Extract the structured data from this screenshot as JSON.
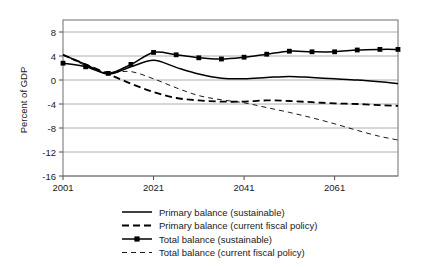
{
  "chart_data": {
    "type": "line",
    "title": "",
    "xlabel": "",
    "ylabel": "Percent of GDP",
    "xlim": [
      2001,
      2075
    ],
    "ylim": [
      -16,
      10
    ],
    "yticks": [
      8,
      4,
      0,
      -4,
      -8,
      -12,
      -16
    ],
    "ytick_labels": [
      "8",
      "4",
      "0",
      "-4",
      "-8",
      "-12",
      "-16"
    ],
    "xticks": [
      2001,
      2021,
      2041,
      2061
    ],
    "xtick_labels": [
      "2001",
      "2021",
      "2041",
      "2061"
    ],
    "grid": "horizontal",
    "legend_position": "bottom",
    "series": [
      {
        "name": "Primary balance (sustainable)",
        "style": "solid",
        "marker": "none",
        "color": "#000000",
        "x": [
          2001,
          2006,
          2011,
          2016,
          2021,
          2026,
          2031,
          2036,
          2041,
          2046,
          2051,
          2056,
          2061,
          2066,
          2071,
          2075
        ],
        "values": [
          4.2,
          2.6,
          1.0,
          2.2,
          3.3,
          2.1,
          1.0,
          0.3,
          0.2,
          0.4,
          0.6,
          0.4,
          0.2,
          0.0,
          -0.3,
          -0.6
        ]
      },
      {
        "name": "Primary balance (current fiscal policy)",
        "style": "dashed",
        "marker": "none",
        "color": "#000000",
        "x": [
          2001,
          2006,
          2011,
          2016,
          2021,
          2026,
          2031,
          2036,
          2041,
          2046,
          2051,
          2056,
          2061,
          2066,
          2071,
          2075
        ],
        "values": [
          4.2,
          2.6,
          1.0,
          -0.6,
          -2.0,
          -3.0,
          -3.4,
          -3.6,
          -3.6,
          -3.4,
          -3.5,
          -3.7,
          -3.9,
          -4.0,
          -4.2,
          -4.3
        ]
      },
      {
        "name": "Total balance (sustainable)",
        "style": "solid",
        "marker": "square",
        "color": "#000000",
        "x": [
          2001,
          2006,
          2011,
          2016,
          2021,
          2026,
          2031,
          2036,
          2041,
          2046,
          2051,
          2056,
          2061,
          2066,
          2071,
          2075
        ],
        "values": [
          2.8,
          2.2,
          1.1,
          2.6,
          4.6,
          4.2,
          3.7,
          3.5,
          3.8,
          4.3,
          4.8,
          4.7,
          4.7,
          5.0,
          5.1,
          5.1
        ]
      },
      {
        "name": "Total balance (current fiscal policy)",
        "style": "thin-dashed",
        "marker": "none",
        "color": "#000000",
        "x": [
          2001,
          2006,
          2011,
          2016,
          2021,
          2026,
          2031,
          2036,
          2041,
          2046,
          2051,
          2056,
          2061,
          2066,
          2071,
          2075
        ],
        "values": [
          4.2,
          2.4,
          1.3,
          1.4,
          0.2,
          -1.3,
          -2.6,
          -3.3,
          -3.8,
          -4.6,
          -5.4,
          -6.3,
          -7.3,
          -8.4,
          -9.4,
          -10.0
        ]
      }
    ]
  },
  "legend": {
    "items": [
      {
        "label": "Primary balance (sustainable)",
        "style": "solid"
      },
      {
        "label": "Primary balance (current fiscal policy)",
        "style": "dashed"
      },
      {
        "label": "Total balance (sustainable)",
        "style": "solid-marker"
      },
      {
        "label": "Total balance (current fiscal policy)",
        "style": "thin-dashed"
      }
    ]
  }
}
